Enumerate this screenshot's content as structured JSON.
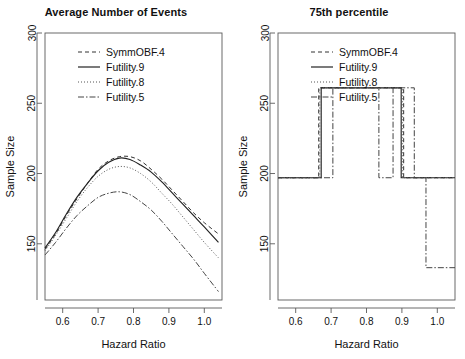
{
  "figure": {
    "width": 465,
    "height": 359,
    "background": "#ffffff",
    "foreground": "#1a1a1a"
  },
  "panels": [
    {
      "id": "left",
      "title": "Average Number of Events",
      "xlabel": "Hazard Ratio",
      "ylabel": "Sample Size"
    },
    {
      "id": "right",
      "title": "75th percentile",
      "xlabel": "Hazard Ratio",
      "ylabel": "Sample Size"
    }
  ],
  "axes": {
    "xticks": [
      0.6,
      0.7,
      0.8,
      0.9,
      1.0
    ],
    "xtick_labels": [
      "0.6",
      "0.7",
      "0.8",
      "0.9",
      "1.0"
    ],
    "yticks": [
      150,
      200,
      250,
      300
    ],
    "ytick_labels": [
      "150",
      "200",
      "250",
      "300"
    ],
    "xlim": [
      0.55,
      1.05
    ],
    "ylim": [
      110,
      300
    ],
    "grid": false
  },
  "legend": {
    "position": "top-center",
    "entries": [
      {
        "label": "SymmOBF.4",
        "style": "dashed",
        "dash": "4,3",
        "color": "#333333"
      },
      {
        "label": "Futility.9",
        "style": "solid",
        "dash": "",
        "color": "#222222"
      },
      {
        "label": "Futility.8",
        "style": "dotted",
        "dash": "1,2",
        "color": "#555555"
      },
      {
        "label": "Futility.5",
        "style": "dashdot",
        "dash": "6,2,1.5,2",
        "color": "#444444"
      }
    ]
  },
  "chart_data": [
    {
      "type": "line",
      "panel": "left",
      "title": "Average Number of Events",
      "xlabel": "Hazard Ratio",
      "ylabel": "Sample Size",
      "xlim": [
        0.55,
        1.05
      ],
      "ylim": [
        110,
        300
      ],
      "grid": false,
      "x": [
        0.55,
        0.58,
        0.61,
        0.64,
        0.67,
        0.7,
        0.73,
        0.76,
        0.79,
        0.82,
        0.85,
        0.88,
        0.91,
        0.94,
        0.97,
        1.0,
        1.04
      ],
      "series": [
        {
          "name": "SymmOBF.4",
          "style": "dashed",
          "values": [
            146,
            157,
            170,
            182,
            193,
            203,
            209,
            212,
            212,
            209,
            203,
            196,
            188,
            180,
            172,
            165,
            157
          ]
        },
        {
          "name": "Futility.9",
          "style": "solid",
          "values": [
            147,
            158,
            171,
            183,
            193,
            202,
            208,
            211,
            210,
            206,
            201,
            194,
            186,
            178,
            170,
            162,
            151
          ]
        },
        {
          "name": "Futility.8",
          "style": "dotted",
          "values": [
            145,
            156,
            168,
            180,
            190,
            198,
            203,
            205,
            204,
            200,
            194,
            186,
            178,
            169,
            160,
            151,
            140
          ]
        },
        {
          "name": "Futility.5",
          "style": "dashdot",
          "values": [
            142,
            151,
            161,
            170,
            177,
            183,
            186,
            187,
            185,
            180,
            174,
            166,
            157,
            148,
            139,
            129,
            116
          ]
        }
      ]
    },
    {
      "type": "line",
      "panel": "right",
      "title": "75th percentile",
      "xlabel": "Hazard Ratio",
      "ylabel": "Sample Size",
      "xlim": [
        0.55,
        1.05
      ],
      "ylim": [
        110,
        300
      ],
      "grid": false,
      "note": "Step functions: all series sit at 197 and jump to 261 over a middle interval; Futility.5 drops to 133 near HR 0.97",
      "series": [
        {
          "name": "SymmOBF.4",
          "style": "dashed",
          "steps": [
            {
              "x_start": 0.55,
              "x_end": 0.665,
              "y": 197
            },
            {
              "x_start": 0.665,
              "x_end": 0.905,
              "y": 261
            },
            {
              "x_start": 0.905,
              "x_end": 1.05,
              "y": 197
            }
          ]
        },
        {
          "name": "Futility.9",
          "style": "solid",
          "steps": [
            {
              "x_start": 0.55,
              "x_end": 0.672,
              "y": 197
            },
            {
              "x_start": 0.672,
              "x_end": 0.898,
              "y": 261
            },
            {
              "x_start": 0.898,
              "x_end": 1.05,
              "y": 197
            }
          ]
        },
        {
          "name": "Futility.8",
          "style": "dotted",
          "steps": [
            {
              "x_start": 0.55,
              "x_end": 0.668,
              "y": 197
            },
            {
              "x_start": 0.668,
              "x_end": 0.902,
              "y": 261
            },
            {
              "x_start": 0.902,
              "x_end": 1.05,
              "y": 197
            }
          ]
        },
        {
          "name": "Futility.5",
          "style": "dashdot",
          "steps": [
            {
              "x_start": 0.55,
              "x_end": 0.705,
              "y": 197
            },
            {
              "x_start": 0.705,
              "x_end": 0.835,
              "y": 261
            },
            {
              "x_start": 0.835,
              "x_end": 0.875,
              "y": 197
            },
            {
              "x_start": 0.875,
              "x_end": 0.935,
              "y": 261
            },
            {
              "x_start": 0.935,
              "x_end": 0.968,
              "y": 197
            },
            {
              "x_start": 0.968,
              "x_end": 1.05,
              "y": 133
            }
          ]
        }
      ]
    }
  ]
}
